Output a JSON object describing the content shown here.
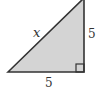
{
  "diagram": {
    "type": "right-triangle",
    "fill_color": "#d4d4d4",
    "stroke_color": "#333333",
    "labels": {
      "hypotenuse": "x",
      "vertical_leg": "5",
      "horizontal_leg": "5"
    },
    "right_angle_marker": true
  }
}
